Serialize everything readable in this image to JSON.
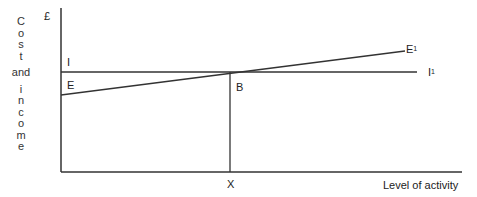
{
  "diagram": {
    "y_axis_currency": "£",
    "y_axis_label_letters": [
      "C",
      "o",
      "s",
      "t",
      "",
      "and",
      "",
      "i",
      "n",
      "c",
      "o",
      "m",
      "e"
    ],
    "x_axis_label": "Level of activity",
    "lines": {
      "income": {
        "start_label": "I",
        "end_label": "I",
        "end_sup": "1"
      },
      "expenditure": {
        "start_label": "E",
        "end_label": "E",
        "end_sup": "1"
      }
    },
    "intersection_label": "B",
    "x_marker_label": "X"
  }
}
